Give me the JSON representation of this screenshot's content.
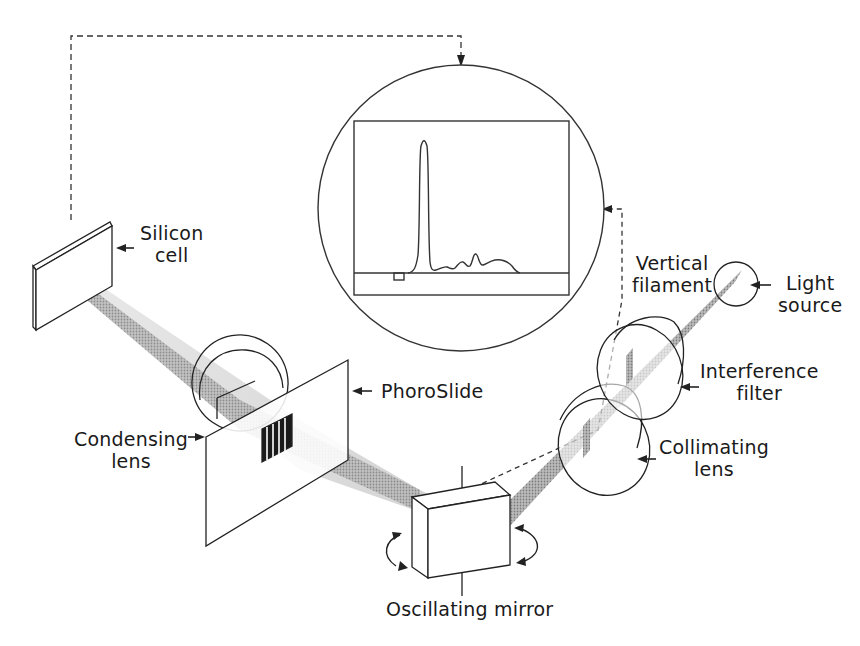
{
  "labels": {
    "silicon_cell": [
      "Silicon",
      "cell"
    ],
    "phoroslide": [
      "PhoroSlide"
    ],
    "condensing_lens": [
      "Condensing",
      "lens"
    ],
    "oscillating_mirror": [
      "Oscillating mirror"
    ],
    "collimating_lens": [
      "Collimating",
      "lens"
    ],
    "interference_filter": [
      "Interference",
      "filter"
    ],
    "vertical_filament": [
      "Vertical",
      "filament"
    ],
    "light_source": [
      "Light",
      "source"
    ]
  },
  "colors": {
    "line": "#222222",
    "beam": "#9a9a9a",
    "beam_light": "#d4d4d4",
    "background": "#ffffff"
  }
}
